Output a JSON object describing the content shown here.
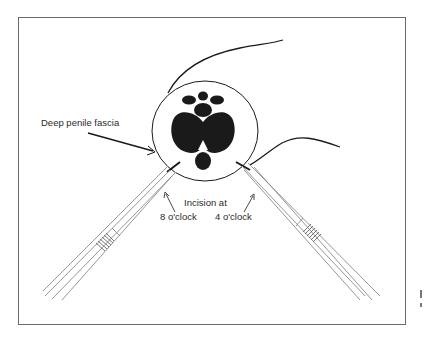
{
  "figure": {
    "labels": {
      "fascia": "Deep penile fascia",
      "incision_line1": "Incision at",
      "incision_left": "8 o'clock",
      "incision_right": "4 o'clock"
    },
    "colors": {
      "ink": "#1a1a1a",
      "frame": "#6a6a6a",
      "instrument": "#8a8a8a",
      "background": "#ffffff"
    },
    "elements": {
      "cross_section": "penile cross-section circle",
      "corpora_cavernosa": "two large dark lobes",
      "corpus_spongiosum": "lower dark oval",
      "dorsal_structures": "three small dark ovals and central vessel",
      "left_instrument": "forceps at 8 o'clock",
      "right_instrument": "forceps at 4 o'clock",
      "sutures": "two curved suture strands"
    }
  }
}
